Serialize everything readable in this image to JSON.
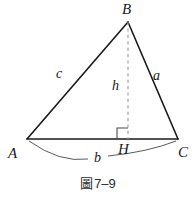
{
  "figure": {
    "caption_cjk": "圖",
    "caption_number": "7–9",
    "background_color": "#ffffff",
    "stroke_color": "#1a1a1a",
    "arc_color": "#4a4a4a",
    "dashed_color": "#9a9a9a"
  },
  "vertices": {
    "a": {
      "label": "A",
      "x": 27,
      "y": 139,
      "label_x": 8,
      "label_y": 148
    },
    "b": {
      "label": "B",
      "x": 128,
      "y": 22,
      "label_x": 122,
      "label_y": 2
    },
    "c": {
      "label": "C",
      "x": 178,
      "y": 139,
      "label_x": 178,
      "label_y": 146
    },
    "h": {
      "label": "H",
      "x": 128,
      "y": 139,
      "label_x": 118,
      "label_y": 143
    }
  },
  "sides": {
    "side_a": {
      "label": "a",
      "label_x": 153,
      "label_y": 69
    },
    "side_b": {
      "label": "b",
      "label_x": 94,
      "label_y": 151
    },
    "side_c": {
      "label": "c",
      "label_x": 56,
      "label_y": 67
    },
    "altitude_h": {
      "label": "h",
      "label_x": 112,
      "label_y": 79
    }
  },
  "markers": {
    "right_angle": {
      "x": 117,
      "y": 128,
      "size": 11
    }
  }
}
